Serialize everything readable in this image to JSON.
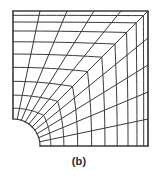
{
  "figure": {
    "caption": "(b)",
    "kind": "finite-element-mesh",
    "line_color": "#3a3a3a",
    "background_color": "#ffffff",
    "line_width": 1
  },
  "mesh_data": {
    "type": "mesh",
    "domain": {
      "outer_left": 13,
      "outer_top": 11,
      "outer_right": 148,
      "outer_bottom": 146
    },
    "hole": {
      "center_x": 13,
      "center_y": 146,
      "radius": 27,
      "quadrant": "upper-right"
    },
    "rings": 10,
    "radial_divisions": 10,
    "ring_blend_exponents": [
      1.0,
      1.12,
      1.26,
      1.44,
      1.66,
      1.95,
      2.35,
      2.95,
      3.9,
      5.6
    ],
    "ring_radii": [
      27,
      31,
      36,
      42,
      50,
      60,
      73,
      90,
      112,
      140
    ],
    "notes": "Concentric rounded-square rings expand from the quarter-circle hole at the lower-left toward the square outer boundary; radial lines connect hole surface to outer edges."
  }
}
